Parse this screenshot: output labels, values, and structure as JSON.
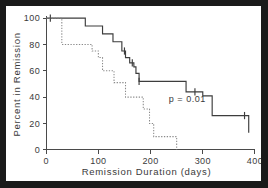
{
  "figure": {
    "border_color": "#1a1a1a",
    "panel_color": "#ffffff"
  },
  "annotation": {
    "p_value_label": "p = 0.01"
  },
  "chart_data": {
    "type": "line",
    "subtype": "kaplan-meier-step",
    "title": "",
    "xlabel": "Remission Duration (days)",
    "ylabel": "Percent in Remission",
    "xlim": [
      0,
      400
    ],
    "ylim": [
      0,
      100
    ],
    "xticks": [
      0,
      100,
      200,
      300,
      400
    ],
    "xtick_labels": [
      "0",
      "100",
      "200",
      "300",
      "400"
    ],
    "yticks": [
      0,
      20,
      40,
      60,
      80,
      100
    ],
    "ytick_labels": [
      "0",
      "20",
      "40",
      "60",
      "80",
      "100"
    ],
    "grid": false,
    "legend": "none",
    "annotations": [
      {
        "text": "p = 0.01",
        "x": 235,
        "y": 36
      }
    ],
    "series": [
      {
        "name": "Treatment group (solid)",
        "style": "solid",
        "color": "#3d3d3d",
        "points": [
          [
            0,
            100
          ],
          [
            42,
            100
          ],
          [
            75,
            100
          ],
          [
            75,
            94
          ],
          [
            108,
            94
          ],
          [
            108,
            88
          ],
          [
            128,
            88
          ],
          [
            128,
            82
          ],
          [
            145,
            82
          ],
          [
            145,
            75
          ],
          [
            152,
            75
          ],
          [
            152,
            70
          ],
          [
            160,
            70
          ],
          [
            160,
            66
          ],
          [
            168,
            66
          ],
          [
            168,
            63
          ],
          [
            172,
            63
          ],
          [
            172,
            58
          ],
          [
            178,
            58
          ],
          [
            178,
            52
          ],
          [
            268,
            52
          ],
          [
            268,
            44
          ],
          [
            300,
            44
          ],
          [
            300,
            41
          ],
          [
            318,
            41
          ],
          [
            318,
            26
          ],
          [
            388,
            26
          ],
          [
            388,
            13
          ]
        ],
        "censored": [
          [
            8,
            100
          ],
          [
            150,
            75
          ],
          [
            165,
            66
          ],
          [
            178,
            52
          ],
          [
            285,
            44
          ],
          [
            380,
            26
          ]
        ]
      },
      {
        "name": "Control group (dotted)",
        "style": "dotted",
        "color": "#8a8a8a",
        "points": [
          [
            0,
            100
          ],
          [
            30,
            100
          ],
          [
            30,
            80
          ],
          [
            88,
            80
          ],
          [
            88,
            75
          ],
          [
            100,
            75
          ],
          [
            100,
            70
          ],
          [
            108,
            70
          ],
          [
            108,
            60
          ],
          [
            130,
            60
          ],
          [
            130,
            51
          ],
          [
            152,
            51
          ],
          [
            152,
            40
          ],
          [
            186,
            40
          ],
          [
            186,
            31
          ],
          [
            198,
            31
          ],
          [
            198,
            20
          ],
          [
            206,
            20
          ],
          [
            206,
            10
          ],
          [
            250,
            10
          ],
          [
            250,
            0
          ]
        ],
        "censored": []
      }
    ]
  }
}
